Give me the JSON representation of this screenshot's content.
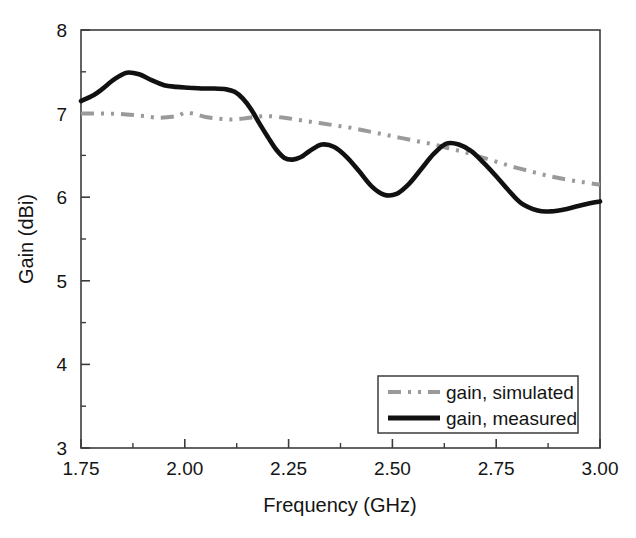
{
  "chart_data": {
    "type": "line",
    "title": "",
    "xlabel": "Frequency (GHz)",
    "ylabel": "Gain (dBi)",
    "xlim": [
      1.75,
      3.0
    ],
    "ylim": [
      3,
      8
    ],
    "grid": false,
    "legend_position": "lower right",
    "xticks": [
      "1.75",
      "2.00",
      "2.25",
      "2.50",
      "2.75",
      "3.00"
    ],
    "xtick_values": [
      1.75,
      2.0,
      2.25,
      2.5,
      2.75,
      3.0
    ],
    "yticks": [
      "3",
      "4",
      "5",
      "6",
      "7",
      "8"
    ],
    "ytick_values": [
      3,
      4,
      5,
      6,
      7,
      8
    ],
    "x_minor_step": 0.125,
    "y_minor_step": 0.5,
    "series": [
      {
        "name": "gain, simulated",
        "style": "dash-dot-dot",
        "color": "#9a9a9a",
        "x": [
          1.75,
          1.78,
          1.82,
          1.86,
          1.9,
          1.94,
          1.98,
          2.0,
          2.02,
          2.05,
          2.08,
          2.11,
          2.14,
          2.17,
          2.2,
          2.24,
          2.28,
          2.32,
          2.36,
          2.4,
          2.44,
          2.48,
          2.52,
          2.56,
          2.6,
          2.64,
          2.68,
          2.72,
          2.76,
          2.8,
          2.84,
          2.88,
          2.92,
          2.96,
          3.0
        ],
        "y": [
          7.0,
          7.0,
          7.0,
          6.99,
          6.97,
          6.95,
          6.97,
          7.01,
          7.0,
          6.96,
          6.94,
          6.93,
          6.94,
          6.96,
          6.97,
          6.95,
          6.92,
          6.89,
          6.86,
          6.83,
          6.79,
          6.75,
          6.71,
          6.67,
          6.63,
          6.58,
          6.53,
          6.47,
          6.41,
          6.35,
          6.3,
          6.25,
          6.21,
          6.18,
          6.15
        ]
      },
      {
        "name": "gain, measured",
        "style": "solid",
        "color": "#111111",
        "x": [
          1.75,
          1.78,
          1.8,
          1.83,
          1.86,
          1.89,
          1.92,
          1.95,
          1.98,
          2.01,
          2.04,
          2.07,
          2.1,
          2.12,
          2.14,
          2.16,
          2.18,
          2.2,
          2.22,
          2.24,
          2.26,
          2.28,
          2.3,
          2.33,
          2.36,
          2.39,
          2.42,
          2.45,
          2.48,
          2.51,
          2.54,
          2.57,
          2.6,
          2.63,
          2.66,
          2.69,
          2.72,
          2.75,
          2.78,
          2.81,
          2.85,
          2.88,
          2.92,
          2.96,
          3.0
        ],
        "y": [
          7.15,
          7.22,
          7.29,
          7.41,
          7.49,
          7.47,
          7.4,
          7.34,
          7.32,
          7.31,
          7.3,
          7.3,
          7.29,
          7.26,
          7.18,
          7.05,
          6.88,
          6.72,
          6.57,
          6.47,
          6.45,
          6.48,
          6.55,
          6.63,
          6.6,
          6.48,
          6.31,
          6.13,
          6.03,
          6.04,
          6.16,
          6.34,
          6.52,
          6.64,
          6.63,
          6.55,
          6.41,
          6.25,
          6.08,
          5.93,
          5.84,
          5.83,
          5.86,
          5.91,
          5.95
        ]
      }
    ]
  },
  "legend": {
    "items": [
      {
        "label": "gain, simulated",
        "marker": "dashed-gray-line"
      },
      {
        "label": "gain, measured",
        "marker": "solid-black-line"
      }
    ]
  },
  "axes": {
    "x_title": "Frequency (GHz)",
    "y_title": "Gain (dBi)"
  }
}
